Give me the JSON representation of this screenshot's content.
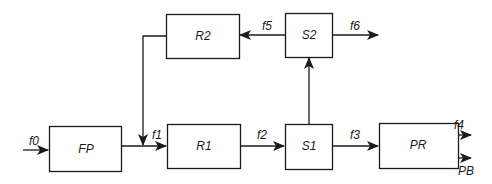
{
  "diagram": {
    "type": "block-flow",
    "blocks": {
      "FP": "FP",
      "R1": "R1",
      "R2": "R2",
      "S1": "S1",
      "S2": "S2",
      "PR": "PR"
    },
    "flows": {
      "f0": "f0",
      "f1": "f1",
      "f2": "f2",
      "f3": "f3",
      "f4": "f4",
      "f5": "f5",
      "f6": "f6",
      "PB": "PB"
    },
    "edges": [
      {
        "from": "input",
        "to": "FP",
        "label": "f0"
      },
      {
        "from": "FP",
        "to": "R1",
        "label": "f1"
      },
      {
        "from": "R2",
        "to": "R1",
        "label": ""
      },
      {
        "from": "R1",
        "to": "S1",
        "label": "f2"
      },
      {
        "from": "S1",
        "to": "PR",
        "label": "f3"
      },
      {
        "from": "S1",
        "to": "S2",
        "label": ""
      },
      {
        "from": "S2",
        "to": "R2",
        "label": "f5"
      },
      {
        "from": "S2",
        "to": "output",
        "label": "f6"
      },
      {
        "from": "PR",
        "to": "output",
        "label": "f4"
      },
      {
        "from": "PR",
        "to": "output",
        "label": "PB"
      }
    ],
    "colors": {
      "stroke": "#1a1a1a",
      "background": "#ffffff"
    }
  }
}
